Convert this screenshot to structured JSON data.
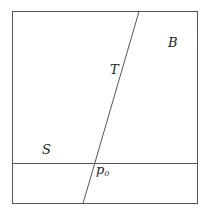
{
  "diagram": {
    "labels": {
      "region_top_right": "B",
      "line_slanted": "T",
      "region_left": "S",
      "point": "p",
      "point_subscript": "0"
    },
    "stroke_color": "#555555"
  }
}
